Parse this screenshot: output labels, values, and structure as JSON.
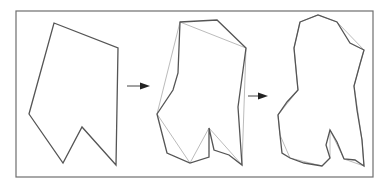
{
  "diagram": {
    "frame": {
      "x": 16,
      "y": 11,
      "width": 357,
      "height": 166,
      "stroke": "#6e6e6e"
    },
    "colors": {
      "main_stroke": "#555555",
      "reference_stroke": "#b3b3b3",
      "arrow": "#222222"
    },
    "stages": [
      {
        "name": "stage-1-coarse",
        "main_points": "54,23 118,48 116,165 82,127 63,163 29,114",
        "reference_points": ""
      },
      {
        "name": "stage-2-refined",
        "main_points": "180,22 217,20 246,48 238,107 242,165 229,155 214,150 209,128 209,157 190,163 167,153 157,114 173,90 178,73",
        "reference_points": "180,22 246,48 242,165 209,128 190,163 157,114"
      },
      {
        "name": "stage-3-smooth",
        "main_points": "300,22 318,15 337,22 350,43 364,50 360,64 354,86 357,110 362,140 364,166 355,160 344,159 337,142 330,130 326,145 330,158 322,166 304,163 290,158 282,153 280,135 278,115 287,102 298,90 297,80 294,48",
        "reference_points": "300,22 318,15 337,22 364,50 360,64 354,86 362,140 364,166 344,159 330,130 330,158 322,166 290,158 280,135 278,115 298,90 294,48"
      }
    ],
    "arrows": [
      {
        "name": "arrow-1",
        "x1": 127,
        "y1": 86,
        "x2": 150,
        "y2": 86
      },
      {
        "name": "arrow-2",
        "x1": 248,
        "y1": 96,
        "x2": 268,
        "y2": 96
      }
    ]
  }
}
